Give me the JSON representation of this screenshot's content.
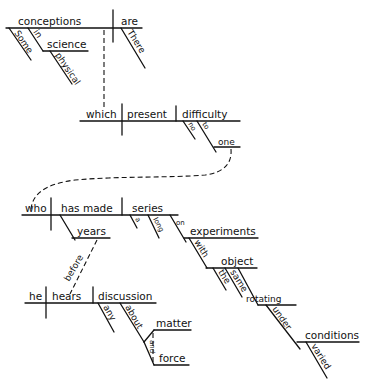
{
  "diagram": {
    "type": "reed-kellogg-sentence-diagram",
    "colors": {
      "ink": "#111111",
      "background": "#ffffff"
    },
    "clauses": [
      {
        "id": "main",
        "subject": "conceptions",
        "verb": "are",
        "modifiers": {
          "some": "Some",
          "in": "in",
          "science": "science",
          "physical": "physical",
          "there": "There"
        }
      },
      {
        "id": "relative-1",
        "subject": "which",
        "verb": "present",
        "object": "difficulty",
        "modifiers": {
          "no": "no",
          "to": "to",
          "one": "one"
        }
      },
      {
        "id": "relative-2",
        "subject": "who",
        "verb": "has made",
        "object": "series",
        "modifiers": {
          "years": "years",
          "a": "a",
          "long": "long",
          "on": "on",
          "experiments": "experiments",
          "with": "with",
          "object": "object",
          "the": "the",
          "same": "same",
          "rotating": "rotating",
          "under": "under",
          "conditions": "conditions",
          "varied": "varied"
        }
      },
      {
        "id": "adverbial",
        "subject": "he",
        "verb": "hears",
        "object": "discussion",
        "connector": "before",
        "modifiers": {
          "any": "any",
          "about": "about",
          "matter": "matter",
          "and": "and",
          "force": "force"
        }
      }
    ]
  }
}
